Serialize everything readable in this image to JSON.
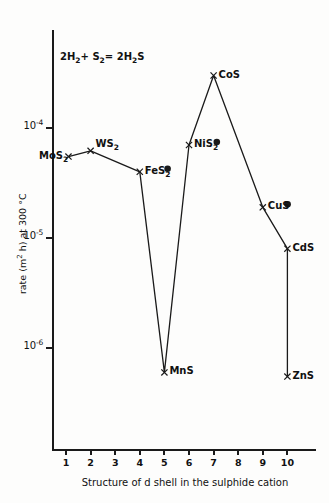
{
  "chart_data": {
    "type": "line",
    "title": "",
    "annotation": "2H2 + S2 = 2H2S",
    "annotation_parts": {
      "a": "2H",
      "a_sub": "2",
      "b": "+ S",
      "b_sub": "2",
      "c": "= 2H",
      "c_sub": "2",
      "d": "S"
    },
    "xlabel": "Structure of d shell in the sulphide cation",
    "ylabel": "rate (m2 h) at 300 °C",
    "ylabel_parts": {
      "pre": "rate (m",
      "sup": "2",
      "post": " h) at 300 °C"
    },
    "xlim": [
      0.5,
      10.8
    ],
    "ylim": [
      3e-07,
      0.0005
    ],
    "yscale": "log",
    "xscale": "linear",
    "grid": false,
    "legend": false,
    "x_tick_labels": [
      "1",
      "2",
      "3",
      "4",
      "5",
      "6",
      "7",
      "8",
      "9",
      "10"
    ],
    "x_tick_values": [
      1,
      2,
      3,
      4,
      5,
      6,
      7,
      8,
      9,
      10
    ],
    "y_tick_labels": [
      "10-4",
      "10-5",
      "10-6"
    ],
    "y_tick_values": [
      0.0001,
      1e-05,
      1e-06
    ],
    "y_tick_parts": [
      {
        "base": "10",
        "exp": "-4"
      },
      {
        "base": "10",
        "exp": "-5"
      },
      {
        "base": "10",
        "exp": "-6"
      }
    ],
    "marker_cross": "x",
    "marker_dot": "●",
    "series": [
      {
        "name": "sulphide catalytic rate",
        "points": [
          {
            "label": "MoS2",
            "label_base": "MoS",
            "label_sub": "2",
            "x": 1.1,
            "y": 5.5e-05,
            "marker": "cross",
            "has_dot": false,
            "label_side": "left"
          },
          {
            "label": "WS2",
            "label_base": "WS",
            "label_sub": "2",
            "x": 2.0,
            "y": 6.2e-05,
            "marker": "cross",
            "has_dot": false,
            "label_side": "right"
          },
          {
            "label": "FeS2",
            "label_base": "FeS",
            "label_sub": "2",
            "x": 4.0,
            "y": 4e-05,
            "marker": "cross",
            "has_dot": true,
            "label_side": "right"
          },
          {
            "label": "MnS",
            "label_base": "MnS",
            "label_sub": "",
            "x": 5.0,
            "y": 6e-07,
            "marker": "cross",
            "has_dot": false,
            "label_side": "right"
          },
          {
            "label": "NiS2",
            "label_base": "NiS",
            "label_sub": "2",
            "x": 6.0,
            "y": 7e-05,
            "marker": "cross",
            "has_dot": true,
            "label_side": "right"
          },
          {
            "label": "CoS",
            "label_base": "CoS",
            "label_sub": "",
            "x": 7.0,
            "y": 0.0003,
            "marker": "cross",
            "has_dot": false,
            "label_side": "right"
          },
          {
            "label": "CuS",
            "label_base": "CuS",
            "label_sub": "",
            "x": 9.0,
            "y": 1.9e-05,
            "marker": "cross",
            "has_dot": true,
            "label_side": "right"
          },
          {
            "label": "CdS",
            "label_base": "CdS",
            "label_sub": "",
            "x": 10.0,
            "y": 8e-06,
            "marker": "cross",
            "has_dot": false,
            "label_side": "right"
          },
          {
            "label": "ZnS",
            "label_base": "ZnS",
            "label_sub": "",
            "x": 10.0,
            "y": 5.5e-07,
            "marker": "cross",
            "has_dot": false,
            "label_side": "right"
          }
        ]
      }
    ],
    "colors": {
      "line": "#1a1a1a",
      "marker": "#1a1a1a",
      "text": "#111111",
      "background": "#fdfdfc"
    }
  }
}
